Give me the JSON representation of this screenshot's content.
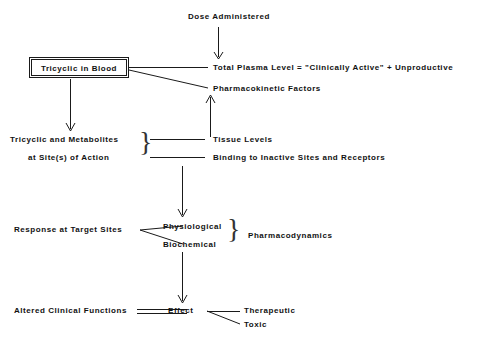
{
  "diagram": {
    "background_color": "#ffffff",
    "line_color": "#1a1a1a",
    "text_color": "#111111",
    "nodes": {
      "dose_administered": "Dose Administered",
      "tricyclic_in_blood": "Tricyclic in Blood",
      "total_plasma_level": "Total Plasma Level  =  \"Clinically Active\"  +  Unproductive",
      "pharmacokinetic_factors": "Pharmacokinetic Factors",
      "tricyclic_and_metabolites": "Tricyclic and Metabolites",
      "at_sites_of_action": "at Site(s) of Action",
      "tissue_levels": "Tissue Levels",
      "binding_to_inactive_sites": "Binding to Inactive Sites and Receptors",
      "response_at_target_sites": "Response at Target Sites",
      "physiological": "Physiological",
      "biochemical": "Biochemical",
      "pharmacodynamics": "Pharmacodynamics",
      "altered_clinical_functions": "Altered Clinical Functions",
      "effect": "Effect",
      "therapeutic": "Therapeutic",
      "toxic": "Toxic"
    },
    "braces": {
      "site_of_action_brace": "}",
      "pharmacodynamics_brace": "}"
    }
  }
}
